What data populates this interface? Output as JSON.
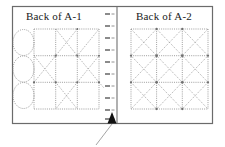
{
  "diagram": {
    "type": "technical-line-drawing",
    "panels": [
      {
        "id": "A-1",
        "title": "Back of A-1",
        "side": "left",
        "grid": {
          "cols": 3,
          "rows": 3
        },
        "diagonal_pattern": "checkerboard",
        "ovals": {
          "count": 3,
          "position": "left-edge"
        }
      },
      {
        "id": "A-2",
        "title": "Back of A-2",
        "side": "right",
        "grid": {
          "cols": 2,
          "rows": 2
        },
        "diagonal_pattern": "all-cells",
        "ovals": {
          "count": 0,
          "position": "none"
        }
      }
    ],
    "spine": {
      "label": "binding-spine",
      "tick_count": 10,
      "orientation": "vertical"
    },
    "callout": {
      "label": "spine-callout",
      "arrow": "up-triangle",
      "leader": "diagonal-down-right"
    },
    "colors": {
      "border": "#6b6b6b",
      "construction_line": "#8c8c8c",
      "spine_line": "#707070",
      "tick": "#767676",
      "arrow": "#111111",
      "leader": "#9a9a9a",
      "text": "#1a1a1a",
      "background": "#ffffff"
    }
  }
}
